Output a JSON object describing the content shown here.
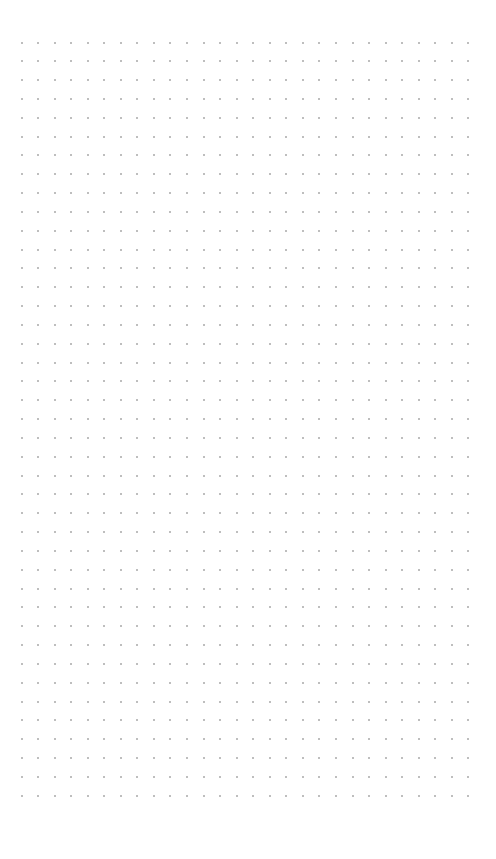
{
  "canvas": {
    "background": "#ffffff",
    "grid": {
      "type": "dot",
      "columns": 28,
      "rows": 41,
      "origin_x": 21.5,
      "origin_y": 42.5,
      "spacing_x": 16.55,
      "spacing_y": 18.83,
      "dot_color": "#a8a8a8",
      "dot_size": 2
    }
  }
}
